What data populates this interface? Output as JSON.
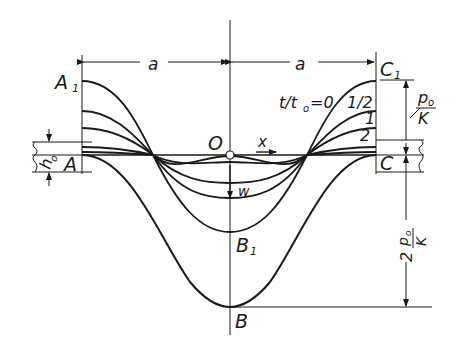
{
  "figure": {
    "colors": {
      "ink": "#1a1a1a",
      "background": "#ffffff"
    },
    "labels": {
      "a_left": "a",
      "a_right": "a",
      "A1": "A",
      "A1_sub": "1",
      "A": "A",
      "C1": "C",
      "C1_sub": "1",
      "C": "C",
      "O": "O",
      "x": "x",
      "w": "w",
      "B1": "B",
      "B1_sub": "1",
      "B": "B",
      "h0": "h",
      "h0_sub": "o",
      "time_param": "t/t",
      "time_param_sub": "o",
      "time_eq": "=0",
      "t_half": "1/2",
      "t_one": "1",
      "t_two": "2",
      "p0_num": "p",
      "p0_num_sub": "o",
      "p0_den": "K",
      "two_p0_coef": "2",
      "two_p0_num": "p",
      "two_p0_num_sub": "o",
      "two_p0_den": "K"
    },
    "curves": [
      {
        "t_over_t0": "0",
        "edge_height_rel": 1.0,
        "center_depth_rel": 0.0
      },
      {
        "t_over_t0": "1/2",
        "edge_height_rel": 0.58
      },
      {
        "t_over_t0": "1",
        "edge_height_rel": 0.36
      },
      {
        "t_over_t0": "2",
        "edge_height_rel": 0.11
      },
      {
        "t_over_t0": "final",
        "edge_height_rel": 0.0,
        "center_depth": "2 p0/K"
      }
    ]
  }
}
